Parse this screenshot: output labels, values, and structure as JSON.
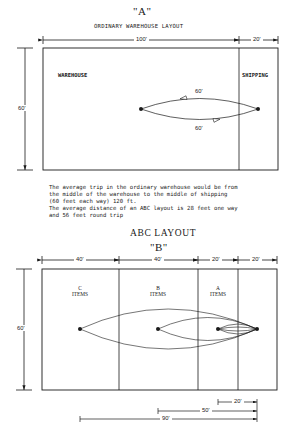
{
  "layout_a": {
    "title": "\"A\"",
    "subtitle": "ORDINARY WAREHOUSE LAYOUT",
    "zones": [
      {
        "label": "WAREHOUSE"
      },
      {
        "label": "SHIPPING"
      }
    ],
    "dimensions": {
      "warehouse_width": "100'",
      "shipping_width": "20'",
      "height": "60'"
    },
    "trip_labels": {
      "outbound": "60'",
      "return": "60'"
    }
  },
  "description": {
    "lines": [
      "The average trip in the ordinary warehouse would be from",
      "the middle of the warehouse to the middle of shipping",
      "(60 feet each way) 120 ft.",
      "The average distance of an ABC layout is 28 feet one way",
      "and 56 feet round trip"
    ]
  },
  "layout_b": {
    "heading": "ABC LAYOUT",
    "title": "\"B\"",
    "zones": [
      {
        "letter": "C",
        "label": "ITEMS"
      },
      {
        "letter": "B",
        "label": "ITEMS"
      },
      {
        "letter": "A",
        "label": "ITEMS"
      }
    ],
    "dimensions": {
      "c_width": "40'",
      "b_width": "40'",
      "a_width": "20'",
      "shipping_width": "20'",
      "height": "60'"
    },
    "distances": {
      "a_to_shipping": "20'",
      "b_to_shipping": "50'",
      "c_to_shipping": "90'"
    }
  },
  "colors": {
    "ink": "#1a1a1a",
    "background": "#ffffff"
  }
}
